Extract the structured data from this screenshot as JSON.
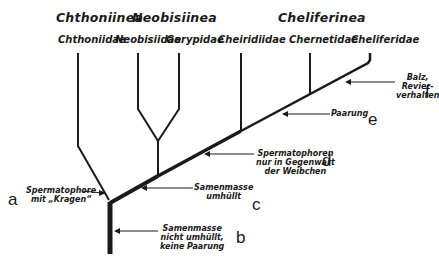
{
  "suborders": [
    {
      "label": "Chthoniinea"
    },
    {
      "label": "Neobisiinea"
    },
    {
      "label": "Cheliferinea"
    }
  ],
  "families": [
    {
      "label": "Chthoniidae"
    },
    {
      "label": "Neobisiidae"
    },
    {
      "label": "Garypidae"
    },
    {
      "label": "Cheiridiidae"
    },
    {
      "label": "Chernetidae"
    },
    {
      "label": "Cheliferidae"
    }
  ],
  "annotations": {
    "a": {
      "letter": "a",
      "line1": "Spermatophore",
      "line2": "mit „Kragen“"
    },
    "b": {
      "letter": "b",
      "line1": "Samenmasse",
      "line2": "nicht umhüllt,",
      "line3": "keine Paarung"
    },
    "c": {
      "letter": "c",
      "line1": "Samenmasse",
      "line2": "umhüllt"
    },
    "d": {
      "letter": "d",
      "line1": "Spermatophoren",
      "line2": "nur in Gegenwart",
      "line3": "der Weibchen"
    },
    "e": {
      "letter": "e",
      "line1": "Paarung"
    },
    "f": {
      "letter": "f",
      "line1": "Balz,",
      "line2": "Revier-",
      "line3": "verhalten"
    }
  },
  "colors": {
    "line": "#1a1a1a",
    "background": "#ffffff"
  }
}
